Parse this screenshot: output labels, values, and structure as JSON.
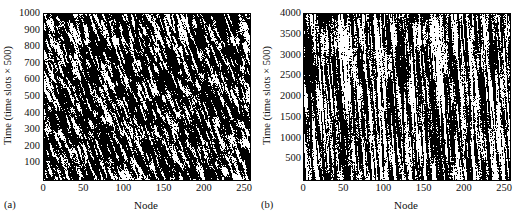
{
  "figure": {
    "panels": [
      {
        "caption": "(a)",
        "xlabel": "Node",
        "ylabel": "Time (time slots × 500)",
        "xticks": [
          "0",
          "50",
          "100",
          "150",
          "200",
          "250"
        ],
        "yticks": [
          "100",
          "200",
          "300",
          "400",
          "500",
          "600",
          "700",
          "800",
          "900",
          "1000"
        ]
      },
      {
        "caption": "(b)",
        "xlabel": "Node",
        "ylabel": "Time (time slots × 500)",
        "xticks": [
          "0",
          "50",
          "100",
          "150",
          "200",
          "250"
        ],
        "yticks": [
          "500",
          "1000",
          "1500",
          "2000",
          "2500",
          "3000",
          "3500",
          "4000"
        ]
      }
    ]
  },
  "chart_data": [
    {
      "type": "heatmap",
      "panel": "(a)",
      "title": "",
      "xlabel": "Node",
      "ylabel": "Time (time slots × 500)",
      "xlim": [
        0,
        256
      ],
      "ylim": [
        0,
        1000
      ],
      "xticks": [
        0,
        50,
        100,
        150,
        200,
        250
      ],
      "yticks": [
        100,
        200,
        300,
        400,
        500,
        600,
        700,
        800,
        900,
        1000
      ],
      "grid": false,
      "legend": "none",
      "colormap": [
        "#000000",
        "#ffffff"
      ],
      "value_range": [
        0,
        1
      ],
      "description": "Binary black-and-white space-time raster of node activity. Dense, mostly-black speckle with fine white flecks organized into short right-leaning diagonal streaks, indicating slowly drifting activation waves across node index over time.",
      "texture": {
        "pattern": "diagonal-streaks",
        "white_fraction": 0.3,
        "streak_angle_deg": 70,
        "streak_length_px": 9,
        "grain_scale_px": 1.6,
        "seed": 20240115
      }
    },
    {
      "type": "heatmap",
      "panel": "(b)",
      "title": "",
      "xlabel": "Node",
      "ylabel": "Time (time slots × 500)",
      "xlim": [
        0,
        256
      ],
      "ylim": [
        0,
        4000
      ],
      "xticks": [
        0,
        50,
        100,
        150,
        200,
        250
      ],
      "yticks": [
        500,
        1000,
        1500,
        2000,
        2500,
        3000,
        3500,
        4000
      ],
      "grid": false,
      "legend": "none",
      "colormap": [
        "#000000",
        "#ffffff"
      ],
      "value_range": [
        0,
        1
      ],
      "description": "Binary black-and-white space-time raster of node activity. Strong near-vertical white striping: individual nodes stay active for long contiguous runs of time slots, producing tall column-like white bands against a black background.",
      "texture": {
        "pattern": "vertical-stripes",
        "white_fraction": 0.42,
        "streak_angle_deg": 86,
        "streak_length_px": 26,
        "grain_scale_px": 1.3,
        "seed": 77310492
      }
    }
  ]
}
